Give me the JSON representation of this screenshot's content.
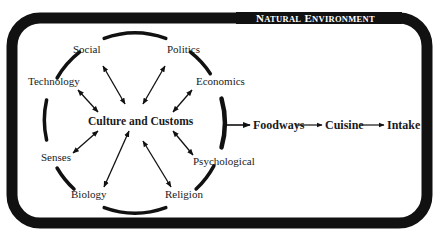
{
  "diagram": {
    "environment": {
      "title": "Natural Environment",
      "title_first_letter_1": "N",
      "title_rest_1": "ATURAL",
      "title_first_letter_2": "E",
      "title_rest_2": "NVIRONMENT"
    },
    "center": {
      "label": "Culture and Customs"
    },
    "factors": [
      {
        "id": "social",
        "label": "Social"
      },
      {
        "id": "politics",
        "label": "Politics"
      },
      {
        "id": "technology",
        "label": "Technology"
      },
      {
        "id": "economics",
        "label": "Economics"
      },
      {
        "id": "senses",
        "label": "Senses"
      },
      {
        "id": "psychological",
        "label": "Psychological"
      },
      {
        "id": "biology",
        "label": "Biology"
      },
      {
        "id": "religion",
        "label": "Religion"
      }
    ],
    "flow": [
      {
        "label": "Foodways"
      },
      {
        "label": "Cuisine"
      },
      {
        "label": "Intake"
      }
    ],
    "colors": {
      "stroke": "#111111",
      "background": "#ffffff",
      "text": "#1a1a1a"
    }
  }
}
